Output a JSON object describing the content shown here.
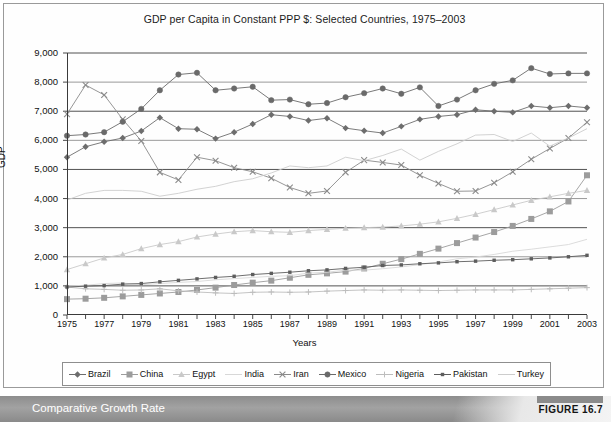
{
  "figure": {
    "caption": "Comparative Growth Rate",
    "number_label": "FIGURE 16.7"
  },
  "chart_data": {
    "type": "line",
    "title": "GDP per Capita in Constant PPP $: Selected Countries, 1975–2003",
    "xlabel": "Years",
    "ylabel": "GDP",
    "xlim": [
      1975,
      2003
    ],
    "ylim": [
      0,
      9000
    ],
    "ytick_step": 1000,
    "ytick_labels": [
      "0",
      "1,000",
      "2,000",
      "3,000",
      "4,000",
      "5,000",
      "6,000",
      "7,000",
      "8,000",
      "9,000"
    ],
    "xtick_labels": [
      "1975",
      "1977",
      "1979",
      "1981",
      "1983",
      "1985",
      "1987",
      "1989",
      "1991",
      "1993",
      "1995",
      "1997",
      "1999",
      "2001",
      "2003"
    ],
    "xtick_step": 2,
    "grid": "horizontal",
    "legend_position": "bottom",
    "x": [
      1975,
      1976,
      1977,
      1978,
      1979,
      1980,
      1981,
      1982,
      1983,
      1984,
      1985,
      1986,
      1987,
      1988,
      1989,
      1990,
      1991,
      1992,
      1993,
      1994,
      1995,
      1996,
      1997,
      1998,
      1999,
      2000,
      2001,
      2002,
      2003
    ],
    "series": [
      {
        "name": "Brazil",
        "marker": "diamond",
        "color": "#6d6d6d",
        "values": [
          5420,
          5780,
          5950,
          6080,
          6320,
          6780,
          6400,
          6380,
          6060,
          6280,
          6560,
          6880,
          6820,
          6680,
          6760,
          6420,
          6330,
          6250,
          6480,
          6720,
          6820,
          6880,
          7050,
          7000,
          6960,
          7180,
          7120,
          7180,
          7120
        ]
      },
      {
        "name": "China",
        "marker": "square",
        "color": "#9c9c9c",
        "values": [
          545,
          560,
          590,
          640,
          690,
          740,
          790,
          860,
          940,
          1030,
          1110,
          1180,
          1280,
          1380,
          1430,
          1490,
          1600,
          1760,
          1920,
          2100,
          2280,
          2470,
          2660,
          2850,
          3060,
          3300,
          3560,
          3900,
          4800
        ]
      },
      {
        "name": "Egypt",
        "marker": "triangle",
        "color": "#c9c9c9",
        "values": [
          1560,
          1760,
          1960,
          2080,
          2280,
          2420,
          2520,
          2680,
          2780,
          2860,
          2900,
          2860,
          2840,
          2900,
          2940,
          2980,
          3000,
          3020,
          3060,
          3120,
          3200,
          3320,
          3460,
          3620,
          3780,
          3940,
          4060,
          4180,
          4280
        ]
      },
      {
        "name": "India",
        "marker": "none",
        "color": "#d8d8d8",
        "values": [
          1000,
          1020,
          1080,
          1100,
          1040,
          1080,
          1120,
          1150,
          1210,
          1250,
          1290,
          1330,
          1350,
          1440,
          1470,
          1540,
          1540,
          1590,
          1650,
          1730,
          1820,
          1930,
          1990,
          2080,
          2190,
          2260,
          2340,
          2420,
          2600
        ]
      },
      {
        "name": "Iran",
        "marker": "x",
        "color": "#8a8a8a",
        "values": [
          6900,
          7900,
          7560,
          6720,
          5980,
          4900,
          4640,
          5420,
          5300,
          5060,
          4920,
          4700,
          4380,
          4180,
          4260,
          4900,
          5320,
          5240,
          5150,
          4800,
          4520,
          4250,
          4260,
          4540,
          4920,
          5350,
          5720,
          6080,
          6620
        ]
      },
      {
        "name": "Mexico",
        "marker": "circle",
        "color": "#6a6a6a",
        "values": [
          6160,
          6200,
          6280,
          6640,
          7080,
          7720,
          8260,
          8320,
          7720,
          7780,
          7840,
          7380,
          7400,
          7240,
          7280,
          7480,
          7620,
          7780,
          7600,
          7820,
          7180,
          7400,
          7720,
          7940,
          8060,
          8480,
          8280,
          8300,
          8300
        ]
      },
      {
        "name": "Nigeria",
        "marker": "plus",
        "color": "#bdbdbd",
        "values": [
          960,
          900,
          880,
          850,
          860,
          900,
          830,
          790,
          760,
          740,
          780,
          790,
          780,
          790,
          820,
          840,
          860,
          850,
          860,
          850,
          840,
          850,
          860,
          860,
          860,
          880,
          900,
          920,
          940
        ]
      },
      {
        "name": "Pakistan",
        "marker": "smallsquare",
        "color": "#5d5d5d",
        "values": [
          960,
          990,
          1010,
          1060,
          1080,
          1140,
          1190,
          1240,
          1290,
          1330,
          1390,
          1430,
          1470,
          1520,
          1550,
          1600,
          1640,
          1700,
          1720,
          1760,
          1790,
          1830,
          1850,
          1880,
          1900,
          1930,
          1960,
          2000,
          2050
        ]
      },
      {
        "name": "Turkey",
        "marker": "none",
        "color": "#cdcdcd",
        "values": [
          3950,
          4180,
          4280,
          4280,
          4250,
          4080,
          4180,
          4320,
          4420,
          4580,
          4680,
          4880,
          5120,
          5060,
          5120,
          5420,
          5300,
          5480,
          5700,
          5320,
          5620,
          5880,
          6180,
          6200,
          5960,
          6250,
          5800,
          6080,
          6400
        ]
      }
    ]
  }
}
